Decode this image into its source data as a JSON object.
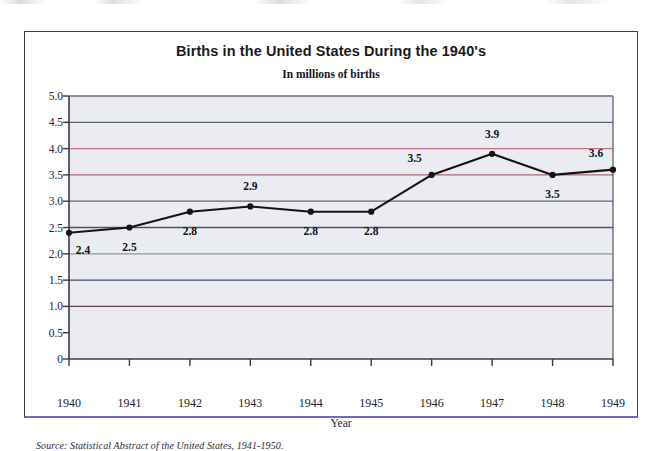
{
  "figure": {
    "title": "Births in the United States During the 1940's",
    "subtitle": "In millions of births",
    "source_note": "Source: Statistical Abstract of the United States, 1941-1950.",
    "frame_border_color": "#3c3c3c",
    "frame_bottom_color": "#6b6bc0",
    "plot_background": "#eaecf1",
    "series_color": "#141414"
  },
  "chart_data": {
    "type": "line",
    "title": "Births in the United States During the 1940's",
    "subtitle": "In millions of births",
    "xlabel": "Year",
    "ylabel": "",
    "categories": [
      "1940",
      "1941",
      "1942",
      "1943",
      "1944",
      "1945",
      "1946",
      "1947",
      "1948",
      "1949"
    ],
    "values": [
      2.4,
      2.5,
      2.8,
      2.9,
      2.8,
      2.8,
      3.5,
      3.9,
      3.5,
      3.6
    ],
    "data_labels": [
      "2.4",
      "2.5",
      "2.8",
      "2.9",
      "2.8",
      "2.8",
      "3.5",
      "3.9",
      "3.5",
      "3.6"
    ],
    "label_positions": [
      "below-right",
      "below",
      "below",
      "above",
      "below",
      "below",
      "above-left",
      "above",
      "below",
      "above-left"
    ],
    "ylim": [
      0,
      5.0
    ],
    "yticks": [
      5.0,
      4.5,
      4.0,
      3.5,
      3.0,
      2.5,
      2.0,
      1.5,
      1.0,
      0.5,
      0
    ],
    "ytick_labels": [
      "5.0",
      "4.5",
      "4.0",
      "3.5",
      "3.0",
      "2.5",
      "2.0",
      "1.5",
      "1.0",
      "0.5",
      "0"
    ],
    "xtick_labels": [
      "1940",
      "1941",
      "1942",
      "1943",
      "1944",
      "1945",
      "1946",
      "1947",
      "1948",
      "1949"
    ],
    "grid": true,
    "grid_colors": {
      "5.0": "#6d6d78",
      "4.5": "#5c6272",
      "4.0": "#c4707f",
      "3.5": "#b9626f",
      "3.0": "#5f6570",
      "2.5": "#4d525e",
      "2.0": "#7fa08c",
      "1.5": "#4a4c74",
      "1.0": "#6d4250",
      "0.5": "#2f7a92"
    },
    "legend": null,
    "source": "Source: Statistical Abstract of the United States, 1941-1950."
  }
}
